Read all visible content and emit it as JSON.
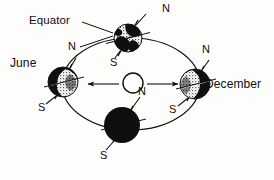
{
  "diagram": {
    "background_color": "#fdfdfb",
    "ink_color": "#100f0d",
    "labels": {
      "equator": "Equator",
      "june": "June",
      "december": "December",
      "north_pole": "N",
      "south_pole": "S"
    },
    "sun": {
      "name": "Sun",
      "fill": "#ffffff",
      "stroke": "#100f0d",
      "cx": 133,
      "cy": 83,
      "r": 10
    },
    "orbit": {
      "name": "orbit-ellipse",
      "cx": 131,
      "cy": 84,
      "rx": 69,
      "ry": 46,
      "stroke": "#100f0d"
    },
    "arrows": [
      {
        "name": "orbit-direction-arrow-left",
        "from_x": 118,
        "to_x": 87,
        "y": 84
      },
      {
        "name": "orbit-direction-arrow-right",
        "from_x": 148,
        "to_x": 179,
        "y": 84
      }
    ],
    "earth_positions": [
      {
        "id": "top",
        "season_label": "",
        "cx": 128,
        "cy": 38,
        "r": 14,
        "lit_side": "mixed",
        "dark_fill": "#100f0d",
        "n_label": "N",
        "s_label": "S",
        "n_label_x": 162,
        "n_label_y": 6,
        "s_label_x": 111,
        "s_label_y": 62
      },
      {
        "id": "june",
        "season_label": "June",
        "cx": 63,
        "cy": 82,
        "r": 15,
        "lit_side": "right",
        "dark_fill": "#100f0d",
        "n_label": "N",
        "s_label": "S",
        "n_label_x": 68,
        "n_label_y": 48,
        "s_label_x": 36,
        "s_label_y": 105,
        "season_label_x": 10,
        "season_label_y": 63
      },
      {
        "id": "bottom",
        "season_label": "",
        "cx": 122,
        "cy": 125,
        "r": 18,
        "lit_side": "none",
        "dark_fill": "#100f0d",
        "n_label": "N",
        "s_label": "S",
        "n_label_x": 138,
        "n_label_y": 89,
        "s_label_x": 100,
        "s_label_y": 155
      },
      {
        "id": "december",
        "season_label": "December",
        "cx": 195,
        "cy": 84,
        "r": 15,
        "lit_side": "left",
        "dark_fill": "#100f0d",
        "n_label": "N",
        "s_label": "S",
        "n_label_x": 200,
        "n_label_y": 50,
        "s_label_x": 161,
        "s_label_y": 108,
        "season_label_x": 205,
        "season_label_y": 79
      }
    ],
    "equator_annotation": {
      "label_x": 29,
      "label_y": 21,
      "leader_to_globe": true,
      "leader_to_pole": true
    }
  }
}
